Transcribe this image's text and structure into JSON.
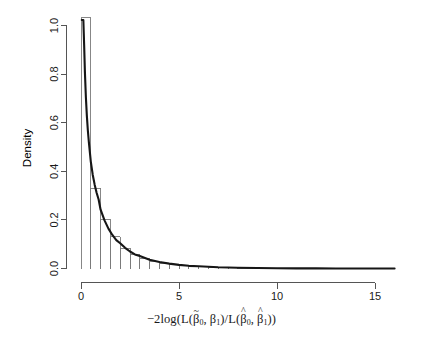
{
  "figure": {
    "type": "histogram-with-density",
    "background_color": "#ffffff",
    "bar_stroke_color": "#7a7a7a",
    "curve_color": "#161616",
    "axis_color": "#555555"
  },
  "axes": {
    "y_title": "Density",
    "x_title_parts": {
      "prefix": "−2log(L(",
      "beta_tilde_0": "β",
      "beta_tilde_0_accent": "~",
      "beta_tilde_0_sub": "0",
      "sep1": ", ",
      "beta_1": "β",
      "beta_1_sub": "1",
      "mid": ")/L(",
      "beta_hat_0": "β",
      "beta_hat_0_accent": "^",
      "beta_hat_0_sub": "0",
      "sep2": ", ",
      "beta_hat_1": "β",
      "beta_hat_1_accent": "^",
      "beta_hat_1_sub": "1",
      "suffix": "))"
    },
    "x_title_plain": "−2log(L(β̃0, β1)/L(β̂0, β̂1))",
    "x_ticks": [
      0,
      5,
      10,
      15
    ],
    "y_ticks": [
      "0.0",
      "0.2",
      "0.4",
      "0.6",
      "0.8",
      "1.0"
    ]
  },
  "chart_data": {
    "type": "bar",
    "title": "",
    "xlabel": "−2log(L(β̃0, β1)/L(β̂0, β̂1))",
    "ylabel": "Density",
    "xlim": [
      0,
      16
    ],
    "ylim": [
      0,
      1.06
    ],
    "xticks": [
      0,
      5,
      10,
      15
    ],
    "yticks": [
      0.0,
      0.2,
      0.4,
      0.6,
      0.8,
      1.0
    ],
    "grid": false,
    "legend": "none",
    "bin_width": 0.5,
    "bin_edges": [
      0,
      0.5,
      1,
      1.5,
      2,
      2.5,
      3,
      3.5,
      4,
      4.5,
      5,
      5.5,
      6,
      6.5,
      7,
      7.5,
      8,
      8.5,
      9,
      9.5,
      10,
      10.5,
      11,
      11.5,
      12,
      12.5,
      13,
      13.5,
      14,
      14.5,
      15,
      15.5,
      16
    ],
    "categories": [
      "0-0.5",
      "0.5-1",
      "1-1.5",
      "1.5-2",
      "2-2.5",
      "2.5-3",
      "3-3.5",
      "3.5-4",
      "4-4.5",
      "4.5-5",
      "5-5.5",
      "5.5-6",
      "6-6.5",
      "6.5-7",
      "7-7.5",
      "7.5-8",
      "8-8.5",
      "8.5-9",
      "9-9.5",
      "9.5-10",
      "10-10.5",
      "10.5-11",
      "11-11.5",
      "11.5-12",
      "12-12.5",
      "12.5-13",
      "13-13.5",
      "13.5-14",
      "14-14.5",
      "14.5-15",
      "15-15.5",
      "15.5-16"
    ],
    "values": [
      1.032,
      0.33,
      0.203,
      0.13,
      0.084,
      0.059,
      0.041,
      0.03,
      0.022,
      0.017,
      0.013,
      0.009,
      0.007,
      0.005,
      0.004,
      0.003,
      0.002,
      0.0018,
      0.0013,
      0.001,
      0.0008,
      0.0006,
      0.0005,
      0.0004,
      0.0003,
      0.0002,
      0.0002,
      0.0001,
      0.0001,
      0.0001,
      5e-05,
      5e-05
    ],
    "series": [
      {
        "name": "histogram",
        "kind": "bar",
        "values": [
          1.032,
          0.33,
          0.203,
          0.13,
          0.084,
          0.059,
          0.041,
          0.03,
          0.022,
          0.017,
          0.013,
          0.009,
          0.007,
          0.005,
          0.004,
          0.003,
          0.002,
          0.0018,
          0.0013,
          0.001,
          0.0008,
          0.0006,
          0.0005,
          0.0004,
          0.0003,
          0.0002,
          0.0002,
          0.0001,
          0.0001,
          0.0001,
          5e-05,
          5e-05
        ]
      },
      {
        "name": "chi-square df=1 density",
        "kind": "line",
        "x": [
          0.04,
          0.08,
          0.12,
          0.16,
          0.2,
          0.25,
          0.3,
          0.35,
          0.4,
          0.5,
          0.6,
          0.7,
          0.8,
          0.9,
          1.0,
          1.2,
          1.4,
          1.6,
          1.8,
          2.0,
          2.25,
          2.5,
          2.75,
          3.0,
          3.5,
          4.0,
          4.5,
          5.0,
          5.5,
          6.0,
          7.0,
          8.0,
          9.0,
          10.0,
          11.0,
          12.0,
          13.0,
          14.0,
          15.0,
          16.0
        ],
        "y": [
          1.955,
          1.358,
          1.086,
          0.921,
          0.807,
          0.704,
          0.627,
          0.568,
          0.521,
          0.44,
          0.385,
          0.344,
          0.311,
          0.284,
          0.242,
          0.198,
          0.164,
          0.138,
          0.117,
          0.104,
          0.085,
          0.07,
          0.058,
          0.051,
          0.036,
          0.027,
          0.02,
          0.015,
          0.011,
          0.009,
          0.005,
          0.003,
          0.002,
          0.001,
          0.0007,
          0.0004,
          0.0003,
          0.0002,
          0.0001,
          7e-05
        ]
      }
    ]
  }
}
